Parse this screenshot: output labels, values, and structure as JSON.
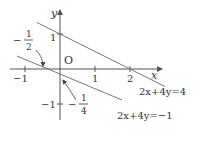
{
  "diagram": {
    "type": "coordinate-plane",
    "colors": {
      "axis": "#555555",
      "line": "#777777",
      "text": "#333333",
      "background": "#ffffff"
    },
    "axes": {
      "x_label": "x",
      "y_label": "y",
      "origin_label": "O",
      "x_ticks": [
        {
          "value": -1,
          "label": "−1"
        },
        {
          "value": 1,
          "label": "1"
        },
        {
          "value": 2,
          "label": "2"
        }
      ],
      "y_ticks": [
        {
          "value": 1,
          "label": "1"
        },
        {
          "value": -1,
          "label": "−1"
        }
      ]
    },
    "lines": [
      {
        "equation": "2x+4y=4",
        "label": "2x+4y=4",
        "x_intercept": 2,
        "y_intercept": 1
      },
      {
        "equation": "2x+4y=−1",
        "label": "2x+4y=−1",
        "x_intercept": -0.5,
        "y_intercept": -0.25
      }
    ],
    "annotations": [
      {
        "text_sign": "−",
        "numerator": "1",
        "denominator": "2",
        "points_to": "x-intercept of 2x+4y=−1"
      },
      {
        "text_sign": "−",
        "numerator": "1",
        "denominator": "4",
        "points_to": "y-intercept of 2x+4y=−1"
      }
    ]
  }
}
